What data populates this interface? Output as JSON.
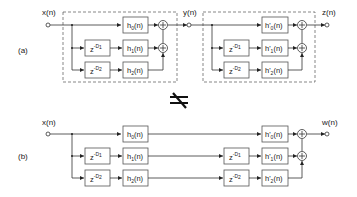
{
  "figure": {
    "panel_a": {
      "label": "(a)",
      "input": "x(n)",
      "intermediate": "y(n)",
      "output": "z(n)",
      "stage1": {
        "delays": [
          {
            "base": "z",
            "exp": "-D",
            "sub": "1"
          },
          {
            "base": "z",
            "exp": "-D",
            "sub": "2"
          }
        ],
        "filters": [
          {
            "name": "h",
            "sub": "0",
            "arg": "(n)"
          },
          {
            "name": "h",
            "sub": "1",
            "arg": "(n)"
          },
          {
            "name": "h",
            "sub": "2",
            "arg": "(n)"
          }
        ]
      },
      "stage2": {
        "delays": [
          {
            "base": "z",
            "exp": "-D",
            "sub": "1"
          },
          {
            "base": "z",
            "exp": "-D",
            "sub": "2"
          }
        ],
        "filters": [
          {
            "name": "h'",
            "sub": "0",
            "arg": "(n)"
          },
          {
            "name": "h'",
            "sub": "1",
            "arg": "(n)"
          },
          {
            "name": "h'",
            "sub": "2",
            "arg": "(n)"
          }
        ]
      }
    },
    "not_equal_symbol": "≠",
    "panel_b": {
      "label": "(b)",
      "input": "x(n)",
      "output": "w(n)",
      "delays_front": [
        {
          "base": "z",
          "exp": "-D",
          "sub": "1"
        },
        {
          "base": "z",
          "exp": "-D",
          "sub": "2"
        }
      ],
      "filters_front": [
        {
          "name": "h",
          "sub": "0",
          "arg": "(n)"
        },
        {
          "name": "h",
          "sub": "1",
          "arg": "(n)"
        },
        {
          "name": "h",
          "sub": "2",
          "arg": "(n)"
        }
      ],
      "delays_back": [
        {
          "base": "z",
          "exp": "-D",
          "sub": "1"
        },
        {
          "base": "z",
          "exp": "-D",
          "sub": "2"
        }
      ],
      "filters_back": [
        {
          "name": "h'",
          "sub": "0",
          "arg": "(n)"
        },
        {
          "name": "h'",
          "sub": "1",
          "arg": "(n)"
        },
        {
          "name": "h'",
          "sub": "2",
          "arg": "(n)"
        }
      ]
    },
    "adder_symbol": "+",
    "colors": {
      "stroke": "#333333",
      "box_stroke": "#555555",
      "background": "#ffffff"
    }
  }
}
